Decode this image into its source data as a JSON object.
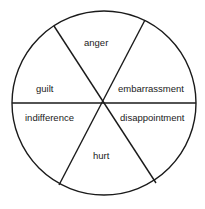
{
  "diagram": {
    "type": "wheel",
    "segments": [
      {
        "label": "anger"
      },
      {
        "label": "embarrassment"
      },
      {
        "label": "disappointment"
      },
      {
        "label": "hurt"
      },
      {
        "label": "indifference"
      },
      {
        "label": "guilt"
      }
    ],
    "colors": {
      "stroke": "#1a1a1a",
      "background": "#ffffff"
    }
  }
}
